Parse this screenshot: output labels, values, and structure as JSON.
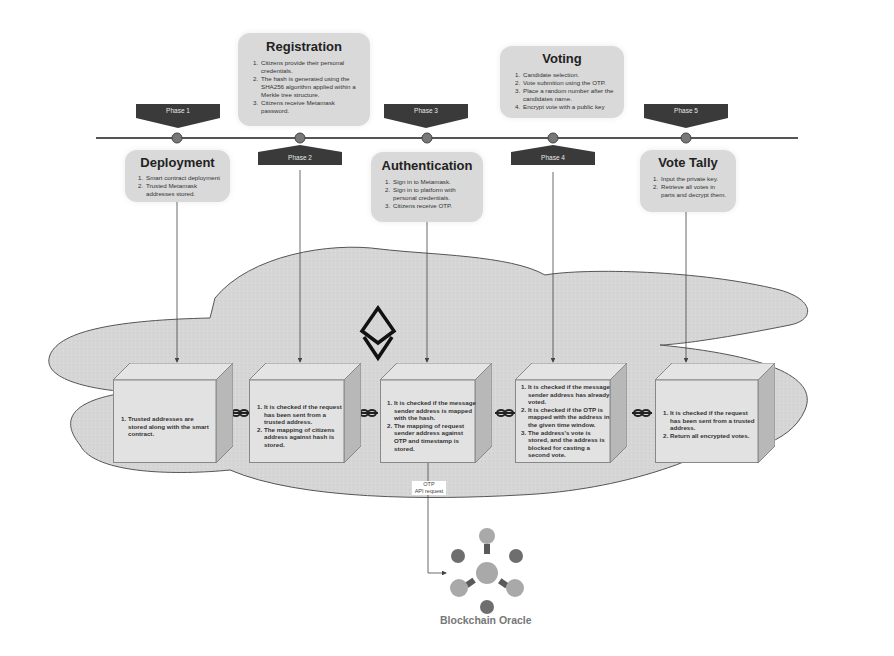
{
  "diagram": {
    "timeline": {
      "phases": [
        {
          "label": "Phase 1",
          "position": "above"
        },
        {
          "label": "Phase 2",
          "position": "below"
        },
        {
          "label": "Phase 3",
          "position": "above"
        },
        {
          "label": "Phase 4",
          "position": "below"
        },
        {
          "label": "Phase 5",
          "position": "above"
        }
      ]
    },
    "stages": [
      {
        "title": "Deployment",
        "steps": [
          "Smart contract deployment",
          "Trusted Metamask addresses stored."
        ]
      },
      {
        "title": "Registration",
        "steps": [
          "Citizens provide their personal credentials.",
          "The hash is generated using the SHA256 algorithm applied within a Merkle tree structure.",
          "Citizens receive Metamask password."
        ]
      },
      {
        "title": "Authentication",
        "steps": [
          "Sign in to Metamask.",
          "Sign in to platform with personal credentials.",
          "Citizens receive OTP."
        ]
      },
      {
        "title": "Voting",
        "steps": [
          "Candidate selection.",
          "Vote submition using the OTP.",
          "Place a random number after the candidates name.",
          "Encrypt vote with a public key"
        ]
      },
      {
        "title": "Vote Tally",
        "steps": [
          "Input the private key.",
          "Retrieve all votes in parts and decrypt them."
        ]
      }
    ],
    "blockchain": {
      "icon": "ethereum-icon",
      "blocks": [
        {
          "steps": [
            "Trusted addresses are stored along with the smart contract."
          ]
        },
        {
          "steps": [
            "It is checked if the request has been sent from a trusted  address.",
            "The mapping of citizens address against hash is stored."
          ]
        },
        {
          "steps": [
            "It is checked if the message sender address is mapped with the hash.",
            "The mapping of request sender address against OTP and timestamp is stored."
          ]
        },
        {
          "steps": [
            "It is checked if the message sender address has already voted.",
            "It is checked if the OTP is mapped with the address in the given time window.",
            "The address's vote is stored, and the address is blocked for casting a second vote."
          ]
        },
        {
          "steps": [
            "It is checked if the request has been sent from a trusted  address.",
            "Return all encrypted votes."
          ]
        }
      ],
      "link_icon": "chain-link-icon"
    },
    "api_request": {
      "line1": "OTP",
      "line2": "API request"
    },
    "oracle": {
      "title": "Blockchain Oracle",
      "icon": "oracle-network-icon"
    },
    "colors": {
      "card_bg": "#d9d9d9",
      "phase_bg": "#3a3a3a",
      "cloud_fill": "#d4d4d4",
      "timeline": "#555555",
      "oracle_light": "#a9a9a9",
      "oracle_dark": "#6e6e6e"
    }
  }
}
